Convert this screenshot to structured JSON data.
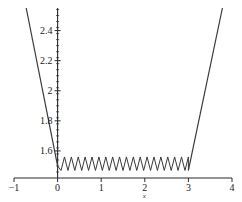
{
  "chart_data": {
    "type": "line",
    "title": "",
    "subtitle": "",
    "xlabel": "x",
    "ylabel": "",
    "xlim": [
      -1,
      4
    ],
    "ylim": [
      1.42,
      2.55
    ],
    "grid": false,
    "legend": null,
    "background_color": "#ffffff",
    "line_color": "#3a3a3a",
    "axis_color": "#2b2b2b",
    "x_ticks": [
      {
        "value": -1,
        "label": "−1"
      },
      {
        "value": 0,
        "label": "0"
      },
      {
        "value": 1,
        "label": "1"
      },
      {
        "value": 2,
        "label": "2"
      },
      {
        "value": 3,
        "label": "3"
      },
      {
        "value": 4,
        "label": "4"
      }
    ],
    "y_ticks": [
      {
        "value": 1.6,
        "label": "1.6"
      },
      {
        "value": 1.8,
        "label": "1.8"
      },
      {
        "value": 2.0,
        "label": "2"
      },
      {
        "value": 2.2,
        "label": "2.2"
      },
      {
        "value": 2.4,
        "label": "2.4"
      }
    ],
    "y_minor_tick_step": 0.04,
    "x_minor_ticks": false,
    "series": [
      {
        "name": "left-branch",
        "description": "steep descending line from upper-left to origin",
        "points": [
          [
            -0.72,
            2.55
          ],
          [
            0.0,
            1.5
          ]
        ]
      },
      {
        "name": "sawtooth-middle",
        "description": "oscillating zigzag between x=0 and x=3 about y=1.5",
        "x_start": 0.0,
        "x_end": 3.0,
        "teeth": 19,
        "baseline": 1.47,
        "peak": 1.56
      },
      {
        "name": "right-branch",
        "description": "steep ascending line from x=3 to upper-right",
        "points": [
          [
            3.0,
            1.47
          ],
          [
            3.78,
            2.55
          ]
        ]
      }
    ]
  }
}
